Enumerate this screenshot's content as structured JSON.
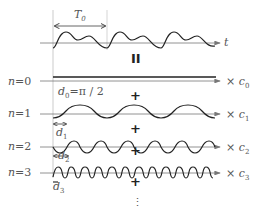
{
  "diagram": {
    "signal": {
      "period_label": "T",
      "period_sub": "0",
      "axis_label": "t"
    },
    "equals_symbol": "II",
    "plus_symbol": "+",
    "ellipsis": "⋮",
    "rows": [
      {
        "n_label": "n = 0",
        "coef": "× c",
        "coef_sub": "0",
        "phase_label": "d",
        "phase_sub": "0",
        "phase_value": "=π / 2"
      },
      {
        "n_label": "n = 1",
        "coef": "× c",
        "coef_sub": "1",
        "phase_label": "d",
        "phase_sub": "1"
      },
      {
        "n_label": "n = 2",
        "coef": "× c",
        "coef_sub": "2",
        "phase_label": "d",
        "phase_sub": "2"
      },
      {
        "n_label": "n = 3",
        "coef": "× c",
        "coef_sub": "3",
        "phase_label": "d",
        "phase_sub": "3"
      }
    ]
  }
}
